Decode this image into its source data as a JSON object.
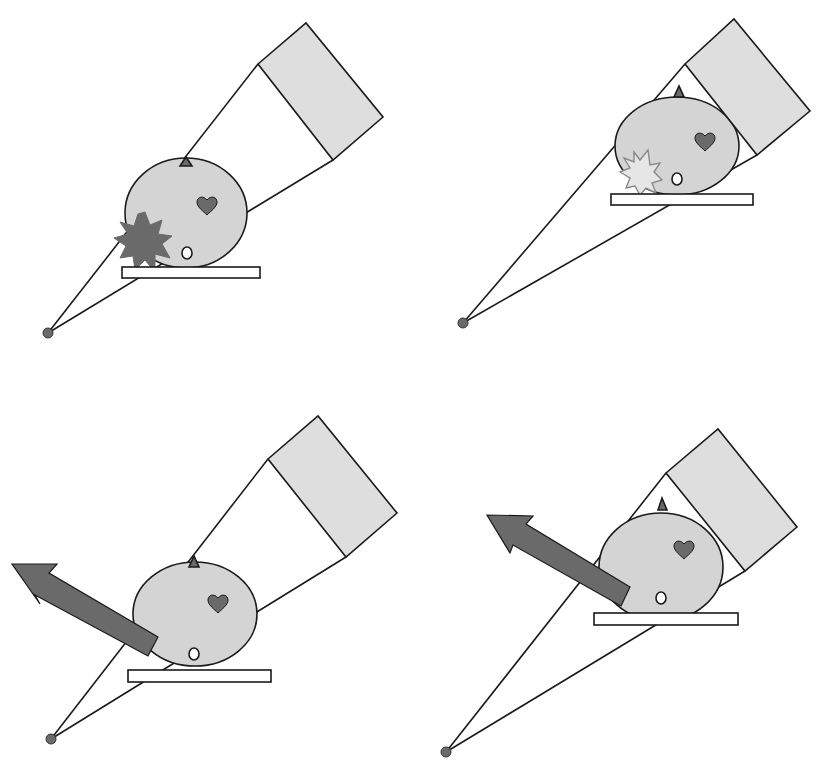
{
  "diagram": {
    "colors": {
      "body_fill": "#d4d4d4",
      "detector_fill": "#dedede",
      "dark_fill": "#6a6a6a",
      "table_fill": "#ffffff",
      "line": "#1a1a1a",
      "light_star_stroke": "#8a8a8a"
    },
    "panels": [
      {
        "id": "top-left",
        "elements": [
          "point-source",
          "beam",
          "body",
          "heart",
          "spinal-marker",
          "nose",
          "table",
          "detector",
          "dark-starburst"
        ]
      },
      {
        "id": "top-right",
        "elements": [
          "point-source",
          "beam",
          "body",
          "heart",
          "spinal-marker",
          "nose",
          "table",
          "detector",
          "light-starburst"
        ]
      },
      {
        "id": "bottom-left",
        "elements": [
          "point-source",
          "beam",
          "body",
          "heart",
          "spinal-marker",
          "nose",
          "table",
          "detector",
          "arrow"
        ]
      },
      {
        "id": "bottom-right",
        "elements": [
          "point-source",
          "beam",
          "body",
          "heart",
          "spinal-marker",
          "nose",
          "table",
          "detector",
          "arrow"
        ]
      }
    ]
  }
}
